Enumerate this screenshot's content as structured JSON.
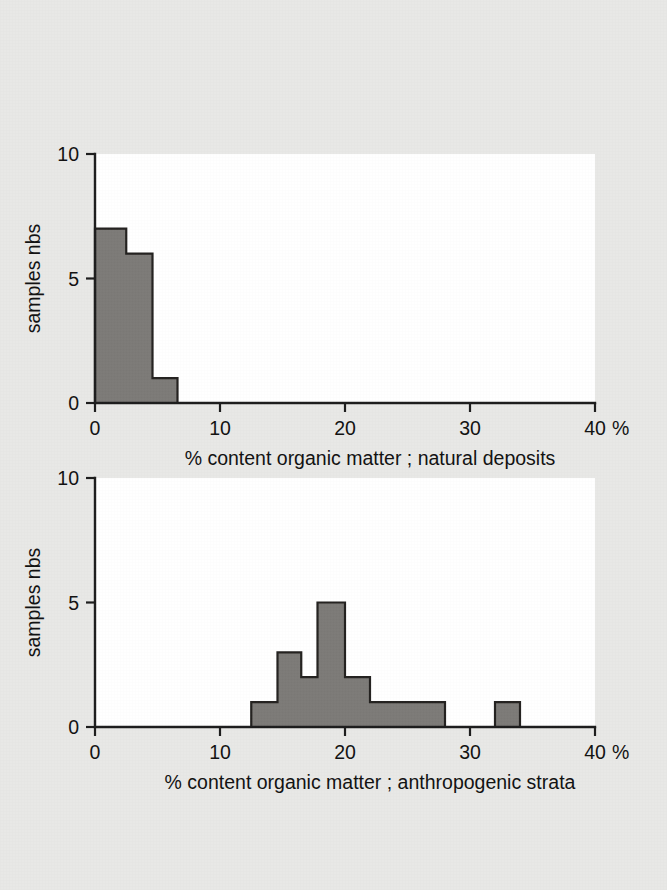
{
  "figure": {
    "background_color": "#e8e8e6",
    "plot_area_color": "#ffffff",
    "bar_fill_color": "#7c7a77",
    "bar_edge_color": "#23211f",
    "axis_color": "#1c1c1c"
  },
  "chart_data": [
    {
      "type": "bar",
      "title": "",
      "xlabel": "% content organic matter ; natural deposits",
      "ylabel": "samples nbs",
      "xlim": [
        0,
        40
      ],
      "ylim": [
        0,
        10
      ],
      "xticks": [
        0,
        10,
        20,
        30,
        40
      ],
      "xtick_labels": [
        "0",
        "10",
        "20",
        "30",
        "40"
      ],
      "x_axis_unit_suffix": "%",
      "yticks": [
        0,
        5,
        10
      ],
      "ytick_labels": [
        "0",
        "5",
        "10"
      ],
      "grid": false,
      "legend": false,
      "bins": [
        {
          "start": 0.0,
          "end": 2.5,
          "count": 7
        },
        {
          "start": 2.5,
          "end": 4.6,
          "count": 6
        },
        {
          "start": 4.6,
          "end": 6.6,
          "count": 1
        }
      ]
    },
    {
      "type": "bar",
      "title": "",
      "xlabel": "% content organic matter ; anthropogenic strata",
      "ylabel": "samples nbs",
      "xlim": [
        0,
        40
      ],
      "ylim": [
        0,
        10
      ],
      "xticks": [
        0,
        10,
        20,
        30,
        40
      ],
      "xtick_labels": [
        "0",
        "10",
        "20",
        "30",
        "40"
      ],
      "x_axis_unit_suffix": "%",
      "yticks": [
        0,
        5,
        10
      ],
      "ytick_labels": [
        "0",
        "5",
        "10"
      ],
      "grid": false,
      "legend": false,
      "bins": [
        {
          "start": 12.5,
          "end": 14.6,
          "count": 1
        },
        {
          "start": 14.6,
          "end": 16.5,
          "count": 3
        },
        {
          "start": 16.5,
          "end": 17.8,
          "count": 2
        },
        {
          "start": 17.8,
          "end": 20.0,
          "count": 5
        },
        {
          "start": 20.0,
          "end": 22.0,
          "count": 2
        },
        {
          "start": 22.0,
          "end": 28.0,
          "count": 1
        },
        {
          "start": 32.0,
          "end": 34.0,
          "count": 1
        }
      ]
    }
  ]
}
